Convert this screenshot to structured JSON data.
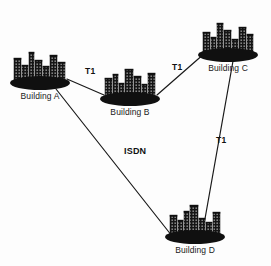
{
  "diagram": {
    "type": "network-topology",
    "background_color": "#fdfdfd",
    "ink_color": "#1a1a1a",
    "nodes": [
      {
        "id": "building-a",
        "label": "Building A",
        "icon": "city-buildings-icon",
        "base_cx": 40,
        "base_cy": 83,
        "base_rx": 30,
        "base_ry": 7,
        "label_x": 40,
        "label_y": 92,
        "skyline": [
          {
            "x": -26,
            "w": 7,
            "h": 24
          },
          {
            "x": -18,
            "w": 6,
            "h": 17
          },
          {
            "x": -11,
            "w": 5,
            "h": 30
          },
          {
            "x": -5,
            "w": 7,
            "h": 22
          },
          {
            "x": 3,
            "w": 6,
            "h": 16
          },
          {
            "x": 10,
            "w": 7,
            "h": 27
          },
          {
            "x": 18,
            "w": 7,
            "h": 20
          }
        ]
      },
      {
        "id": "building-b",
        "label": "Building B",
        "icon": "city-buildings-icon",
        "base_cx": 130,
        "base_cy": 99,
        "base_rx": 30,
        "base_ry": 7,
        "label_x": 130,
        "label_y": 108,
        "skyline": [
          {
            "x": -25,
            "w": 7,
            "h": 20
          },
          {
            "x": -17,
            "w": 5,
            "h": 24
          },
          {
            "x": -11,
            "w": 5,
            "h": 15
          },
          {
            "x": -5,
            "w": 8,
            "h": 29
          },
          {
            "x": 4,
            "w": 7,
            "h": 22
          },
          {
            "x": 12,
            "w": 5,
            "h": 14
          },
          {
            "x": 18,
            "w": 7,
            "h": 25
          }
        ]
      },
      {
        "id": "building-c",
        "label": "Building C",
        "icon": "city-buildings-icon",
        "base_cx": 228,
        "base_cy": 55,
        "base_rx": 30,
        "base_ry": 7,
        "label_x": 228,
        "label_y": 64,
        "skyline": [
          {
            "x": -25,
            "w": 7,
            "h": 22
          },
          {
            "x": -17,
            "w": 5,
            "h": 17
          },
          {
            "x": -11,
            "w": 6,
            "h": 31
          },
          {
            "x": -4,
            "w": 7,
            "h": 24
          },
          {
            "x": 4,
            "w": 6,
            "h": 15
          },
          {
            "x": 11,
            "w": 7,
            "h": 27
          },
          {
            "x": 19,
            "w": 6,
            "h": 20
          }
        ]
      },
      {
        "id": "building-d",
        "label": "Building D",
        "icon": "city-buildings-icon",
        "base_cx": 195,
        "base_cy": 237,
        "base_rx": 30,
        "base_ry": 7,
        "label_x": 195,
        "label_y": 246,
        "skyline": [
          {
            "x": -25,
            "w": 7,
            "h": 21
          },
          {
            "x": -17,
            "w": 5,
            "h": 16
          },
          {
            "x": -11,
            "w": 5,
            "h": 25
          },
          {
            "x": -5,
            "w": 8,
            "h": 31
          },
          {
            "x": 4,
            "w": 6,
            "h": 18
          },
          {
            "x": 11,
            "w": 6,
            "h": 14
          },
          {
            "x": 18,
            "w": 7,
            "h": 24
          }
        ]
      }
    ],
    "links": [
      {
        "id": "link-a-b",
        "from": "building-a",
        "to": "building-b",
        "label": "T1",
        "x1": 67,
        "y1": 79,
        "x2": 104,
        "y2": 95,
        "label_x": 85,
        "label_y": 67
      },
      {
        "id": "link-b-c",
        "from": "building-b",
        "to": "building-c",
        "label": "T1",
        "x1": 157,
        "y1": 95,
        "x2": 205,
        "y2": 53,
        "label_x": 172,
        "label_y": 63
      },
      {
        "id": "link-c-d",
        "from": "building-c",
        "to": "building-d",
        "label": "T1",
        "x1": 233,
        "y1": 61,
        "x2": 203,
        "y2": 230,
        "label_x": 216,
        "label_y": 136
      },
      {
        "id": "link-a-d",
        "from": "building-a",
        "to": "building-d",
        "label": "ISDN",
        "x1": 56,
        "y1": 89,
        "x2": 172,
        "y2": 236,
        "label_x": 124,
        "label_y": 147
      }
    ]
  }
}
